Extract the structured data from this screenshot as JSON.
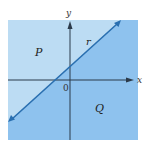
{
  "diagram": {
    "axes": {
      "x_label": "x",
      "y_label": "y",
      "origin_label": "0"
    },
    "line_label": "r",
    "regions": {
      "upper": "P",
      "lower": "Q"
    },
    "colors": {
      "region_p": "#bcdcf3",
      "region_q": "#8ec2ee",
      "line": "#2a6fb0",
      "axis": "#2b3a4a"
    }
  }
}
